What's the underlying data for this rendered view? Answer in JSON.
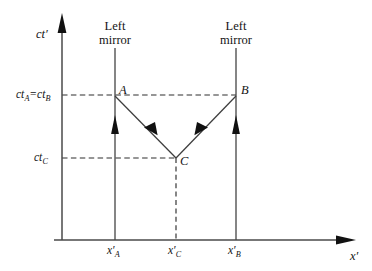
{
  "figure": {
    "kind": "spacetime-diagram",
    "title_present": false,
    "background_color": "#ffffff",
    "line_color": "#3a3a3a",
    "text_color": "#141414"
  },
  "axes": {
    "vertical": {
      "label": "ct",
      "label_prime": "′",
      "name": "ct-prime-axis",
      "has_arrow": true
    },
    "horizontal": {
      "label": "x",
      "label_prime": "′",
      "name": "x-prime-axis",
      "has_arrow": true
    }
  },
  "mirrors": [
    {
      "id": "left-mirror",
      "line1": "Left",
      "line2": "mirror",
      "has_up_arrow": true
    },
    {
      "id": "right-mirror",
      "line1": "Left",
      "line2": "mirror",
      "has_up_arrow": true
    }
  ],
  "events": [
    {
      "id": "A",
      "label": "A"
    },
    {
      "id": "B",
      "label": "B"
    },
    {
      "id": "C",
      "label": "C"
    }
  ],
  "time_ticks": [
    {
      "id": "ct-A-equals-ct-B",
      "base1": "ct",
      "sub1": "A",
      "eq": "=",
      "base2": "ct",
      "sub2": "B"
    },
    {
      "id": "ct-C",
      "base1": "ct",
      "sub1": "C"
    }
  ],
  "space_ticks": [
    {
      "id": "x-prime-A",
      "base": "x",
      "prime": "′",
      "sub": "A"
    },
    {
      "id": "x-prime-C",
      "base": "x",
      "prime": "′",
      "sub": "C"
    },
    {
      "id": "x-prime-B",
      "base": "x",
      "prime": "′",
      "sub": "B"
    }
  ],
  "rays": [
    {
      "id": "ray-C-to-A",
      "from": "C",
      "to": "A",
      "arrow": "up-left"
    },
    {
      "id": "ray-C-to-B",
      "from": "C",
      "to": "B",
      "arrow": "up-right"
    }
  ],
  "guides": [
    {
      "id": "guide-horizontal-AB",
      "style": "dashed"
    },
    {
      "id": "guide-horizontal-C",
      "style": "dashed"
    },
    {
      "id": "guide-vertical-C",
      "style": "dashed"
    }
  ]
}
